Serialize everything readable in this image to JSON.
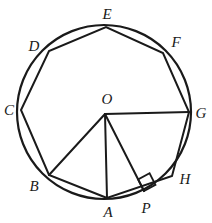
{
  "figure": {
    "width": 212,
    "height": 223,
    "background_color": "#ffffff",
    "stroke_color": "#1a1a1a",
    "circle": {
      "name": "circumscribed-circle",
      "center_x": 104,
      "center_y": 112,
      "radius": 87,
      "stroke_width": 2.2
    },
    "polygon": {
      "name": "regular-octagon",
      "sides": 8,
      "stroke_width": 2.0,
      "vertex_order": [
        "A",
        "B",
        "C",
        "D",
        "E",
        "F",
        "G",
        "H"
      ]
    },
    "vertices": [
      {
        "id": "A",
        "label": "A",
        "x": 107,
        "y": 198,
        "label_x": 108,
        "label_y": 212
      },
      {
        "id": "B",
        "label": "B",
        "x": 49,
        "y": 175,
        "label_x": 34,
        "label_y": 186
      },
      {
        "id": "C",
        "label": "C",
        "x": 21,
        "y": 110,
        "label_x": 9,
        "label_y": 110
      },
      {
        "id": "D",
        "label": "D",
        "x": 49,
        "y": 51,
        "label_x": 34,
        "label_y": 46
      },
      {
        "id": "E",
        "label": "E",
        "x": 106,
        "y": 27,
        "label_x": 107,
        "label_y": 14
      },
      {
        "id": "F",
        "label": "F",
        "x": 163,
        "y": 53,
        "label_x": 176,
        "label_y": 42
      },
      {
        "id": "G",
        "label": "G",
        "x": 189,
        "y": 112,
        "label_x": 201,
        "label_y": 113
      },
      {
        "id": "H",
        "label": "H",
        "x": 172,
        "y": 176,
        "label_x": 185,
        "label_y": 179
      }
    ],
    "center_point": {
      "id": "O",
      "label": "O",
      "x": 105,
      "y": 114,
      "label_x": 107,
      "label_y": 99
    },
    "foot_point": {
      "id": "P",
      "label": "P",
      "x": 144,
      "y": 191,
      "label_x": 146,
      "label_y": 208
    },
    "radii": [
      {
        "name": "radius-OA",
        "from": "O",
        "to": "A",
        "stroke_width": 2.0
      },
      {
        "name": "radius-OB",
        "from": "O",
        "to": "B",
        "stroke_width": 2.0
      },
      {
        "name": "radius-OG",
        "from": "O",
        "to": "G",
        "stroke_width": 2.0
      },
      {
        "name": "perpendicular-OP",
        "from": "O",
        "to": "P",
        "stroke_width": 2.0
      }
    ],
    "right_angle_marker": {
      "name": "right-angle-marker-at-P",
      "size": 13,
      "center_x": 137,
      "center_y": 176,
      "stroke_width": 1.8
    }
  }
}
